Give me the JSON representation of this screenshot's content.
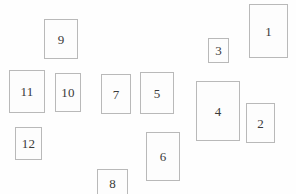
{
  "canvas": {
    "width": 296,
    "height": 194,
    "background_color": "#fefefe",
    "description": "Scatter of outlined rectangles each labeled with a number"
  },
  "style": {
    "border_color": "#b9b9b9",
    "fill_color": "#fdfdfd",
    "label_color": "#3a3a3a",
    "border_width_px": 1,
    "label_font_size_px": 13
  },
  "rectangles": [
    {
      "label": "1",
      "x": 249,
      "y": 4,
      "w": 39,
      "h": 54
    },
    {
      "label": "2",
      "x": 246,
      "y": 103,
      "w": 29,
      "h": 40
    },
    {
      "label": "3",
      "x": 208,
      "y": 38,
      "w": 21,
      "h": 25
    },
    {
      "label": "4",
      "x": 196,
      "y": 81,
      "w": 44,
      "h": 60
    },
    {
      "label": "5",
      "x": 140,
      "y": 72,
      "w": 34,
      "h": 42
    },
    {
      "label": "6",
      "x": 146,
      "y": 132,
      "w": 34,
      "h": 49
    },
    {
      "label": "7",
      "x": 101,
      "y": 74,
      "w": 30,
      "h": 40
    },
    {
      "label": "8",
      "x": 97,
      "y": 169,
      "w": 31,
      "h": 28
    },
    {
      "label": "9",
      "x": 44,
      "y": 19,
      "w": 34,
      "h": 40
    },
    {
      "label": "10",
      "x": 55,
      "y": 73,
      "w": 26,
      "h": 39
    },
    {
      "label": "11",
      "x": 9,
      "y": 70,
      "w": 36,
      "h": 43
    },
    {
      "label": "12",
      "x": 15,
      "y": 127,
      "w": 27,
      "h": 33
    }
  ]
}
